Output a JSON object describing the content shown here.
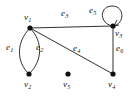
{
  "figure": {
    "type": "undirected-multigraph-diagram",
    "background_color": "#ffffff",
    "stroke_color": "#1a1a1a",
    "vertex_color": "#111111",
    "width": 134,
    "height": 96
  },
  "graph_data": {
    "type": "diagram",
    "vertices": [
      {
        "id": "v1",
        "label": "v",
        "sub": "1",
        "x": 30,
        "y": 28,
        "label_x": 24,
        "label_y": 13,
        "radius": 2.6
      },
      {
        "id": "v2",
        "label": "v",
        "sub": "2",
        "x": 29,
        "y": 74,
        "label_x": 24,
        "label_y": 80,
        "radius": 2.6
      },
      {
        "id": "v3",
        "label": "v",
        "sub": "3",
        "x": 113,
        "y": 26,
        "label_x": 115,
        "label_y": 29,
        "radius": 2.6
      },
      {
        "id": "v4",
        "label": "v",
        "sub": "4",
        "x": 113,
        "y": 74,
        "label_x": 108,
        "label_y": 80,
        "radius": 2.6
      },
      {
        "id": "v5",
        "label": "v",
        "sub": "5",
        "x": 68,
        "y": 74,
        "label_x": 63,
        "label_y": 80,
        "radius": 2.6
      }
    ],
    "edges": [
      {
        "id": "e1",
        "label": "e",
        "sub": "1",
        "from": "v1",
        "to": "v2",
        "shape": "curve-left",
        "label_x": 6,
        "label_y": 43
      },
      {
        "id": "e2",
        "label": "e",
        "sub": "2",
        "from": "v1",
        "to": "v2",
        "shape": "curve-right",
        "label_x": 36,
        "label_y": 43
      },
      {
        "id": "e3",
        "label": "e",
        "sub": "3",
        "from": "v1",
        "to": "v3",
        "shape": "straight",
        "label_x": 61,
        "label_y": 9
      },
      {
        "id": "e4",
        "label": "e",
        "sub": "4",
        "from": "v1",
        "to": "v4",
        "shape": "straight",
        "label_x": 73,
        "label_y": 44
      },
      {
        "id": "e5",
        "label": "e",
        "sub": "5",
        "from": "v3",
        "to": "v3",
        "shape": "self-loop",
        "label_x": 89,
        "label_y": 6
      },
      {
        "id": "e6",
        "label": "e",
        "sub": "6",
        "from": "v3",
        "to": "v4",
        "shape": "straight",
        "label_x": 116,
        "label_y": 44
      }
    ],
    "isolated_vertices": [
      "v5"
    ],
    "notes": "v1 and v2 joined by a pair of parallel curved edges forming a lens; v3 carries a self-loop; v5 has no incident edges."
  }
}
